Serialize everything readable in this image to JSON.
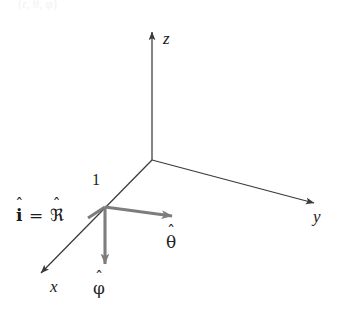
{
  "figure": {
    "type": "vector-diagram",
    "top_caption": "(r, θ, φ)",
    "colors": {
      "axis": "#3a3a3a",
      "vector": "#7d7d7d",
      "text": "#1a1a1a",
      "background": "#ffffff"
    },
    "axes": [
      {
        "id": "z",
        "label": "z",
        "direction": "up"
      },
      {
        "id": "y",
        "label": "y",
        "direction": "down-right"
      },
      {
        "id": "x",
        "label": "x",
        "direction": "down-left"
      }
    ],
    "origin_label": "",
    "tick": {
      "label": "1",
      "on_axis": "x"
    },
    "vectors": [
      {
        "id": "i-hat",
        "label_plain": "i",
        "hat": "ˆ",
        "identity_lhs": "i",
        "identity_eq": "=",
        "identity_rhs": "ℜ",
        "description": "unit vector i-hat equals script R-hat, along the x direction"
      },
      {
        "id": "theta-hat",
        "label_plain": "θ",
        "hat": "ˆ",
        "description": "theta-hat, pointing away from the point toward lower right"
      },
      {
        "id": "phi-hat",
        "label_plain": "φ",
        "hat": "ˆ",
        "description": "phi-hat, pointing straight down from the point"
      }
    ]
  }
}
